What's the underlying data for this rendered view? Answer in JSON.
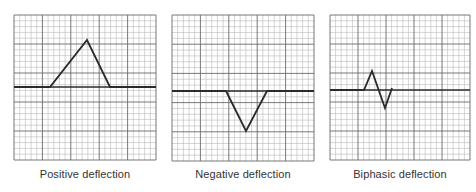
{
  "figure": {
    "panels": [
      {
        "id": "positive",
        "caption": "Positive deflection",
        "left": 14,
        "width": 142,
        "height": 145,
        "baseline_y": 72,
        "waveform": [
          [
            0,
            72
          ],
          [
            36,
            72
          ],
          [
            73,
            25
          ],
          [
            96,
            72
          ],
          [
            142,
            72
          ]
        ]
      },
      {
        "id": "negative",
        "caption": "Negative deflection",
        "left": 172,
        "width": 142,
        "height": 146,
        "baseline_y": 76,
        "waveform": [
          [
            0,
            76
          ],
          [
            54,
            76
          ],
          [
            74,
            116
          ],
          [
            95,
            76
          ],
          [
            142,
            76
          ]
        ]
      },
      {
        "id": "biphasic",
        "caption": "Biphasic deflection",
        "left": 330,
        "width": 140,
        "height": 145,
        "baseline_y": 75,
        "waveform": [
          [
            0,
            75
          ],
          [
            34,
            75
          ],
          [
            42,
            56
          ],
          [
            55,
            93
          ],
          [
            62,
            73
          ]
        ]
      }
    ],
    "grid": {
      "minor_divisions": 25,
      "major_every": 5,
      "minor_color": "#b8b8b8",
      "major_color": "#6a6a6a",
      "baseline_color": "#2a2a2a",
      "trace_color": "#2a2a2a"
    }
  }
}
